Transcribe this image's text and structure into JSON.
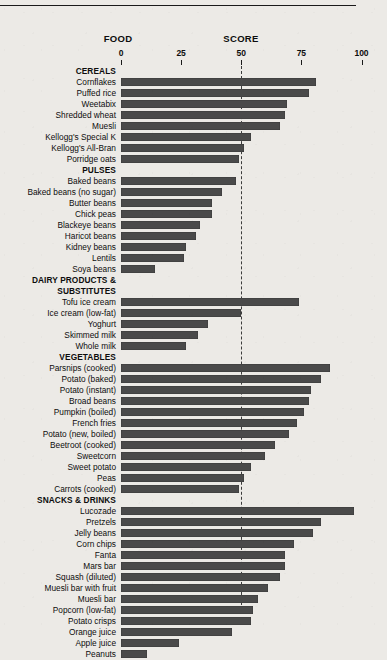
{
  "header": {
    "food_label": "FOOD",
    "score_label": "SCORE"
  },
  "chart_data": {
    "type": "bar",
    "orientation": "horizontal",
    "title": "",
    "xlabel": "SCORE",
    "ylabel": "FOOD",
    "xlim": [
      0,
      100
    ],
    "tick_values": [
      0,
      25,
      50,
      75,
      100
    ],
    "tick_labels": [
      "0",
      "25",
      "50",
      "75",
      "100"
    ],
    "grid": false,
    "reference_line": 50,
    "bar_color": "#4a4a4a",
    "groups": [
      {
        "name": "CEREALS",
        "categories": [
          "Cornflakes",
          "Puffed rice",
          "Weetabix",
          "Shredded wheat",
          "Muesli",
          "Kellogg's Special K",
          "Kellogg's All-Bran",
          "Porridge oats"
        ],
        "values": [
          81,
          78,
          69,
          68,
          66,
          54,
          51,
          49
        ]
      },
      {
        "name": "PULSES",
        "categories": [
          "Baked beans",
          "Baked beans (no sugar)",
          "Butter beans",
          "Chick peas",
          "Blackeye beans",
          "Haricot beans",
          "Kidney beans",
          "Lentils",
          "Soya beans"
        ],
        "values": [
          48,
          42,
          38,
          38,
          33,
          31,
          27,
          26,
          14
        ]
      },
      {
        "name": "DAIRY PRODUCTS & SUBSTITUTES",
        "name_lines": [
          "DAIRY PRODUCTS &",
          "SUBSTITUTES"
        ],
        "categories": [
          "Tofu ice cream",
          "Ice cream (low-fat)",
          "Yoghurt",
          "Skimmed milk",
          "Whole milk"
        ],
        "values": [
          74,
          50,
          36,
          32,
          27
        ]
      },
      {
        "name": "VEGETABLES",
        "categories": [
          "Parsnips (cooked)",
          "Potato (baked)",
          "Potato (instant)",
          "Broad beans",
          "Pumpkin (boiled)",
          "French fries",
          "Potato (new, boiled)",
          "Beetroot (cooked)",
          "Sweetcorn",
          "Sweet potato",
          "Peas",
          "Carrots (cooked)"
        ],
        "values": [
          87,
          83,
          79,
          78,
          76,
          73,
          70,
          64,
          60,
          54,
          51,
          49
        ]
      },
      {
        "name": "SNACKS & DRINKS",
        "categories": [
          "Lucozade",
          "Pretzels",
          "Jelly beans",
          "Corn chips",
          "Fanta",
          "Mars bar",
          "Squash (diluted)",
          "Muesli bar with fruit",
          "Muesli bar",
          "Popcorn (low-fat)",
          "Potato crisps",
          "Orange juice",
          "Apple juice",
          "Peanuts"
        ],
        "values": [
          97,
          83,
          80,
          72,
          68,
          68,
          66,
          61,
          57,
          55,
          54,
          46,
          24,
          11
        ]
      }
    ]
  }
}
